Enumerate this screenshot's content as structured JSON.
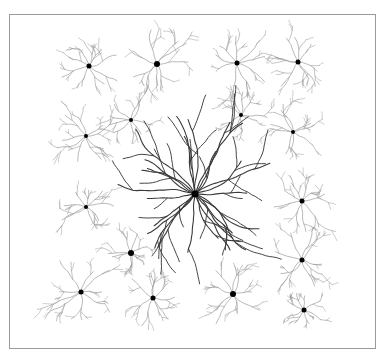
{
  "figure": {
    "frame": {
      "x": 9,
      "y": 14,
      "width": 367,
      "height": 335,
      "color": "#9a9a9a"
    },
    "colors": {
      "background": "#ffffff",
      "small_dendrite": "#9c9c9c",
      "large_dendrite": "#3a3a3a",
      "soma": "#000000"
    },
    "central_neuron": {
      "x": 195,
      "y": 194,
      "soma_r": 3.5,
      "branches": 26,
      "length": 85
    },
    "small_neurons": [
      {
        "x": 89,
        "y": 66,
        "soma_r": 2.5,
        "size": 30
      },
      {
        "x": 157,
        "y": 64,
        "soma_r": 3,
        "size": 34
      },
      {
        "x": 237,
        "y": 63,
        "soma_r": 2.5,
        "size": 34
      },
      {
        "x": 298,
        "y": 62,
        "soma_r": 2.5,
        "size": 28
      },
      {
        "x": 86,
        "y": 136,
        "soma_r": 2,
        "size": 30
      },
      {
        "x": 131,
        "y": 120,
        "soma_r": 2,
        "size": 24
      },
      {
        "x": 241,
        "y": 115,
        "soma_r": 2,
        "size": 26
      },
      {
        "x": 293,
        "y": 132,
        "soma_r": 2,
        "size": 32
      },
      {
        "x": 86,
        "y": 207,
        "soma_r": 2,
        "size": 28
      },
      {
        "x": 302,
        "y": 201,
        "soma_r": 2.5,
        "size": 30
      },
      {
        "x": 131,
        "y": 253,
        "soma_r": 3,
        "size": 22
      },
      {
        "x": 302,
        "y": 260,
        "soma_r": 2.5,
        "size": 32
      },
      {
        "x": 81,
        "y": 292,
        "soma_r": 2.5,
        "size": 36
      },
      {
        "x": 153,
        "y": 298,
        "soma_r": 2.5,
        "size": 30
      },
      {
        "x": 233,
        "y": 294,
        "soma_r": 3,
        "size": 32
      },
      {
        "x": 304,
        "y": 310,
        "soma_r": 2.5,
        "size": 22
      }
    ]
  }
}
